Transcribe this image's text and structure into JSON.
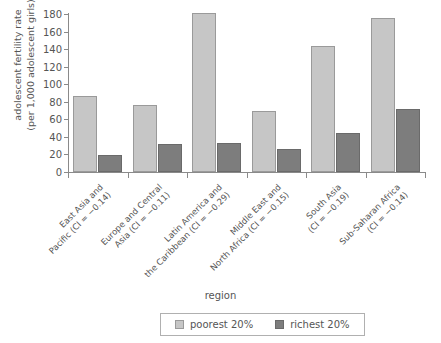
{
  "chart_data": {
    "type": "bar",
    "title": "",
    "xlabel": "region",
    "ylabel": "adolescent fertility rate\n(per 1,000 adolescent girls)",
    "ylim": [
      0,
      180
    ],
    "yticks": [
      0,
      20,
      40,
      60,
      80,
      100,
      120,
      140,
      160,
      180
    ],
    "grid": false,
    "legend_position": "bottom-center",
    "categories": [
      "East Asia and\nPacific (CI = −0.14)",
      "Europe and Central\nAsia (CI = −0.11)",
      "Latin America and\nthe Caribbean (CI = −0.29)",
      "Middle East and\nNorth Africa (CI = −0.15)",
      "South Asia\n(CI = −0.19)",
      "Sub-Saharan Africa\n(CI = −0.14)"
    ],
    "series": [
      {
        "name": "poorest 20%",
        "color": "#c6c6c6",
        "values": [
          87,
          76,
          181,
          69,
          144,
          175
        ]
      },
      {
        "name": "richest 20%",
        "color": "#7d7d7d",
        "values": [
          19,
          32,
          33,
          26,
          44,
          72
        ]
      }
    ]
  },
  "legend": {
    "items": [
      {
        "label": "poorest 20%"
      },
      {
        "label": "richest 20%"
      }
    ]
  }
}
